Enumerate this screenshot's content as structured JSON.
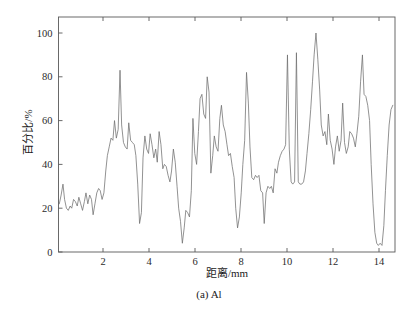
{
  "figure": {
    "caption": "(a) Al",
    "background_color": "#ffffff"
  },
  "chart_data": {
    "type": "line",
    "title": "",
    "subtitle": "",
    "xlabel": "距离/mm",
    "ylabel": "百分比/%",
    "xlim": [
      0.1,
      14.6
    ],
    "ylim": [
      0,
      107
    ],
    "xticks": [
      2,
      4,
      6,
      8,
      10,
      12,
      14
    ],
    "xtick_labels": [
      "2",
      "4",
      "6",
      "8",
      "10",
      "12",
      "14"
    ],
    "yticks": [
      0,
      20,
      40,
      60,
      80,
      100
    ],
    "ytick_labels": [
      "0",
      "20",
      "40",
      "60",
      "80",
      "100"
    ],
    "grid": false,
    "legend": null,
    "legend_position": "none",
    "line_color": "#6e6e6e",
    "series": [
      {
        "name": "Al",
        "x": [
          0.1,
          0.18,
          0.26,
          0.33,
          0.41,
          0.49,
          0.57,
          0.64,
          0.72,
          0.8,
          0.88,
          0.95,
          1.03,
          1.11,
          1.19,
          1.26,
          1.34,
          1.42,
          1.5,
          1.57,
          1.65,
          1.73,
          1.81,
          1.88,
          1.96,
          2.04,
          2.12,
          2.19,
          2.27,
          2.35,
          2.43,
          2.5,
          2.58,
          2.66,
          2.74,
          2.81,
          2.89,
          2.97,
          3.05,
          3.12,
          3.2,
          3.28,
          3.36,
          3.43,
          3.51,
          3.59,
          3.67,
          3.74,
          3.82,
          3.9,
          3.98,
          4.05,
          4.13,
          4.21,
          4.29,
          4.36,
          4.44,
          4.52,
          4.6,
          4.67,
          4.75,
          4.83,
          4.91,
          4.98,
          5.06,
          5.14,
          5.22,
          5.29,
          5.37,
          5.45,
          5.53,
          5.6,
          5.68,
          5.76,
          5.84,
          5.91,
          5.99,
          6.07,
          6.15,
          6.22,
          6.3,
          6.38,
          6.46,
          6.53,
          6.61,
          6.69,
          6.77,
          6.84,
          6.92,
          7.0,
          7.08,
          7.15,
          7.23,
          7.31,
          7.39,
          7.46,
          7.54,
          7.62,
          7.7,
          7.77,
          7.85,
          7.93,
          8.01,
          8.08,
          8.16,
          8.24,
          8.32,
          8.39,
          8.47,
          8.55,
          8.63,
          8.7,
          8.78,
          8.86,
          8.94,
          9.01,
          9.09,
          9.17,
          9.25,
          9.32,
          9.4,
          9.48,
          9.56,
          9.63,
          9.71,
          9.79,
          9.87,
          9.94,
          10.02,
          10.1,
          10.18,
          10.25,
          10.33,
          10.41,
          10.49,
          10.56,
          10.64,
          10.72,
          10.8,
          10.87,
          10.95,
          11.03,
          11.11,
          11.18,
          11.26,
          11.34,
          11.42,
          11.49,
          11.57,
          11.65,
          11.73,
          11.8,
          11.88,
          11.96,
          12.04,
          12.11,
          12.19,
          12.27,
          12.35,
          12.42,
          12.5,
          12.58,
          12.66,
          12.73,
          12.81,
          12.89,
          12.97,
          13.04,
          13.12,
          13.2,
          13.28,
          13.35,
          13.43,
          13.51,
          13.59,
          13.66,
          13.74,
          13.82,
          13.9,
          13.97,
          14.05,
          14.13,
          14.21,
          14.28,
          14.36,
          14.44,
          14.52,
          14.6
        ],
        "y": [
          22,
          26,
          31,
          24,
          20,
          19,
          21,
          20,
          24,
          23,
          21,
          25,
          22,
          19,
          23,
          27,
          22,
          26,
          24,
          17,
          22,
          27,
          29,
          28,
          24,
          27,
          37,
          44,
          48,
          52,
          51,
          60,
          52,
          56,
          83,
          58,
          50,
          48,
          47,
          59,
          51,
          50,
          49,
          44,
          31,
          13,
          18,
          43,
          53,
          47,
          45,
          54,
          49,
          43,
          47,
          41,
          55,
          49,
          38,
          40,
          39,
          35,
          32,
          37,
          47,
          41,
          30,
          20,
          14,
          4,
          11,
          19,
          18,
          16,
          28,
          61,
          45,
          40,
          55,
          70,
          72,
          63,
          61,
          80,
          73,
          36,
          44,
          53,
          48,
          46,
          61,
          67,
          58,
          55,
          49,
          44,
          45,
          39,
          34,
          20,
          11,
          16,
          27,
          40,
          51,
          82,
          68,
          48,
          34,
          33,
          35,
          34,
          35,
          28,
          27,
          13,
          27,
          30,
          29,
          30,
          27,
          38,
          36,
          41,
          44,
          46,
          47,
          49,
          90,
          47,
          32,
          31,
          32,
          91,
          32,
          31,
          31,
          32,
          37,
          45,
          54,
          65,
          78,
          90,
          100,
          88,
          74,
          58,
          53,
          55,
          49,
          63,
          51,
          47,
          40,
          48,
          53,
          46,
          51,
          68,
          50,
          45,
          48,
          55,
          54,
          52,
          48,
          54,
          62,
          78,
          90,
          72,
          71,
          67,
          60,
          40,
          22,
          9,
          4,
          3,
          4,
          3,
          12,
          28,
          44,
          58,
          65,
          67
        ]
      }
    ]
  },
  "axes": {
    "y_axis_label": "百分比/%",
    "x_axis_label": "距离/mm"
  }
}
